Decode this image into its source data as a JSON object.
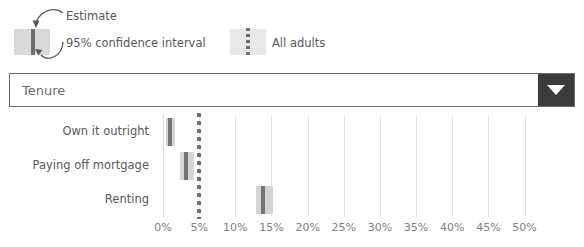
{
  "legend": {
    "estimate_label": "Estimate",
    "ci_label": "95% confidence interval",
    "all_adults_label": "All adults",
    "estimate_swatch_name": "estimate-swatch",
    "all_adults_swatch_name": "all-adults-swatch"
  },
  "dropdown": {
    "value": "Tenure",
    "caret_icon": "chevron-down-icon"
  },
  "chart_data": {
    "type": "bar",
    "title": "",
    "xlabel": "",
    "ylabel": "",
    "orientation": "horizontal",
    "categories": [
      "Own it outright",
      "Paying off mortgage",
      "Renting"
    ],
    "estimates": [
      1.0,
      3.2,
      13.8
    ],
    "ci_low": [
      0.4,
      2.3,
      12.8
    ],
    "ci_high": [
      1.7,
      4.3,
      15.2
    ],
    "reference_line": {
      "label": "All adults",
      "value": 5.0,
      "style": "dashed"
    },
    "xlim": [
      0,
      52
    ],
    "xticks": [
      0,
      5,
      10,
      15,
      20,
      25,
      30,
      35,
      40,
      45,
      50
    ],
    "xtick_labels": [
      "0%",
      "5%",
      "10%",
      "15%",
      "20%",
      "25%",
      "30%",
      "35%",
      "40%",
      "45%",
      "50%"
    ],
    "grid": true,
    "legend_position": "top"
  },
  "colors": {
    "ci_band": "#d4d4d4",
    "estimate_line": "#757575",
    "reference_line": "#6d6e71",
    "gridline": "#e3e3e3",
    "text": "#58595b",
    "tick_text": "#808080",
    "dropdown_button": "#3b3b3b",
    "dropdown_border": "#6d6e71"
  }
}
